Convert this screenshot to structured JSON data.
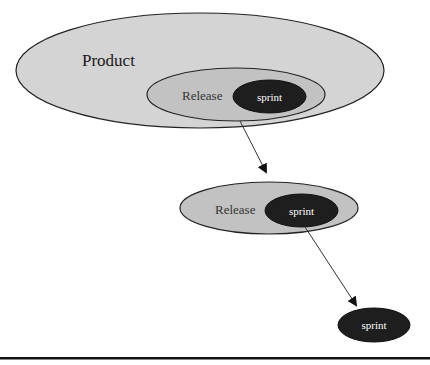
{
  "diagram": {
    "product": {
      "label": "Product",
      "fill": "#d4d4d4",
      "stroke": "#222222"
    },
    "release_nested": {
      "label": "Release",
      "fill": "#c2c2c2",
      "stroke": "#222222"
    },
    "sprint_nested": {
      "label": "sprint",
      "fill": "#1e1e1e",
      "text_color": "#ffffff"
    },
    "release_standalone": {
      "label": "Release",
      "fill": "#c2c2c2",
      "stroke": "#222222"
    },
    "sprint_in_release": {
      "label": "sprint",
      "fill": "#1e1e1e",
      "text_color": "#ffffff"
    },
    "sprint_standalone": {
      "label": "sprint",
      "fill": "#1e1e1e",
      "text_color": "#ffffff"
    },
    "arrows": [
      {
        "from": "release_nested",
        "to": "release_standalone"
      },
      {
        "from": "sprint_in_release",
        "to": "sprint_standalone"
      }
    ]
  }
}
